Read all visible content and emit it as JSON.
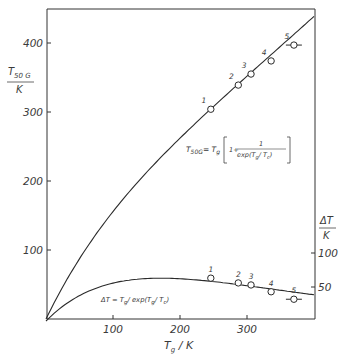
{
  "chart_data": {
    "type": "line",
    "title": "",
    "xlabel": "T_g / K",
    "ylabel_left": "T_50G / K",
    "ylabel_right": "ΔT / K",
    "xlim": [
      0,
      400
    ],
    "ylim_left": [
      0,
      450
    ],
    "ylim_right": [
      0,
      450
    ],
    "x_ticks": [
      100,
      200,
      300
    ],
    "y_ticks_left": [
      100,
      200,
      300,
      400
    ],
    "y_ticks_right": [
      50,
      100
    ],
    "grid": false,
    "Tc": 171,
    "series": [
      {
        "name": "T_50G = T_g [1 + 1/exp(T_g/T_c)]",
        "axis": "left",
        "kind": "curve",
        "points": [
          {
            "label": "1",
            "x": 246,
            "y": 304
          },
          {
            "label": "2",
            "x": 287,
            "y": 339
          },
          {
            "label": "3",
            "x": 306,
            "y": 355
          },
          {
            "label": "4",
            "x": 336,
            "y": 374
          },
          {
            "label": "5",
            "x": 370,
            "y": 397,
            "xerr": 8
          }
        ]
      },
      {
        "name": "ΔT = T_g / exp(T_g/T_c)",
        "axis": "right",
        "kind": "curve",
        "points": [
          {
            "label": "1",
            "x": 246,
            "y": 63
          },
          {
            "label": "2",
            "x": 287,
            "y": 56
          },
          {
            "label": "3",
            "x": 306,
            "y": 53
          },
          {
            "label": "4",
            "x": 336,
            "y": 43
          },
          {
            "label": "5",
            "x": 370,
            "y": 32,
            "xerr": 8
          }
        ]
      }
    ],
    "annotations": [
      "T_50G = T_g [1 + 1/exp(T_g/T_c)]",
      "ΔT = T_g / exp(T_g/T_c)"
    ]
  },
  "labels": {
    "x_ticks": [
      "100",
      "200",
      "300"
    ],
    "y_left_ticks": [
      "100",
      "200",
      "300",
      "400"
    ],
    "y_right_ticks": [
      "50",
      "100"
    ],
    "xlabel_main": "T",
    "xlabel_sub": "g",
    "xlabel_unit": " / K",
    "ylabel_left_main": "T",
    "ylabel_left_sub": "50 G",
    "ylabel_left_unit": "K",
    "ylabel_right_main": "ΔT",
    "ylabel_right_unit": "K",
    "upper_formula_lhs": "T",
    "upper_formula_lhs_sub": "50G",
    "upper_formula_eq": "= T",
    "upper_formula_eq_sub": "g",
    "upper_formula_one": "1+",
    "upper_formula_num": "1",
    "upper_formula_den": "exp(T",
    "upper_formula_den_sub": "g",
    "upper_formula_den2": "/ T",
    "upper_formula_den_sub2": "c",
    "upper_formula_den3": ")",
    "lower_formula": "ΔT = T",
    "lower_formula_sub": "g",
    "lower_formula_mid": "/ exp(T",
    "lower_formula_sub2": "g",
    "lower_formula_mid2": "/ T",
    "lower_formula_sub3": "c",
    "lower_formula_end": ")",
    "point_labels": [
      "1",
      "2",
      "3",
      "4",
      "5"
    ]
  }
}
